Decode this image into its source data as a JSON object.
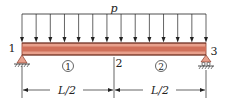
{
  "diagram": {
    "load": {
      "label": "p",
      "arrow_count": 14
    },
    "nodes": [
      {
        "id": "1",
        "label": "1"
      },
      {
        "id": "2",
        "label": "2"
      },
      {
        "id": "3",
        "label": "3"
      }
    ],
    "elements": [
      {
        "id": "1",
        "label": "1"
      },
      {
        "id": "2",
        "label": "2"
      }
    ],
    "supports": [
      {
        "node": "1",
        "type": "pin"
      },
      {
        "node": "3",
        "type": "roller"
      }
    ],
    "dimensions": [
      {
        "label": "L/2"
      },
      {
        "label": "L/2"
      }
    ],
    "colors": {
      "beam_fill": "#e8a08c",
      "beam_center": "#d0705a",
      "beam_edge": "#8a3a2a",
      "support_fill": "#e8a08c",
      "line": "#222222"
    }
  }
}
